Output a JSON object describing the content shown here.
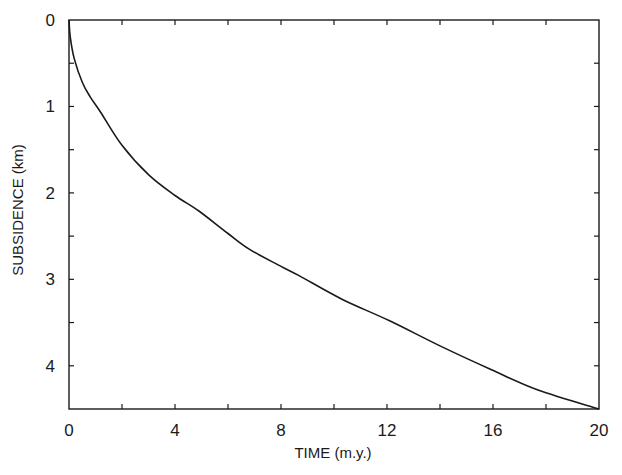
{
  "chart_data": {
    "type": "line",
    "title": "",
    "xlabel": "TIME  (m.y.)",
    "ylabel": "SUBSIDENCE  (km)",
    "xlim": [
      0,
      20
    ],
    "ylim": [
      0,
      4.5
    ],
    "y_inverted": true,
    "grid": false,
    "legend": null,
    "x_ticks": [
      0,
      4,
      8,
      12,
      16,
      20
    ],
    "x_minor_ticks": [
      2,
      6,
      10,
      14,
      18
    ],
    "y_ticks": [
      0,
      1,
      2,
      3,
      4
    ],
    "y_minor_ticks": [
      0.5,
      1.5,
      2.5,
      3.5
    ],
    "series": [
      {
        "name": "subsidence",
        "color": "#1a1a1a",
        "x": [
          0,
          0.05,
          0.2,
          0.5,
          0.8,
          1.2,
          2.0,
          3.0,
          4.0,
          4.9,
          6.0,
          6.8,
          8.0,
          8.7,
          10.3,
          12.1,
          14.0,
          15.9,
          17.7,
          20.0
        ],
        "y": [
          0,
          0.2,
          0.45,
          0.72,
          0.89,
          1.07,
          1.45,
          1.79,
          2.03,
          2.21,
          2.47,
          2.65,
          2.85,
          2.96,
          3.23,
          3.48,
          3.77,
          4.04,
          4.28,
          4.5
        ]
      }
    ]
  },
  "caption_fragment": ""
}
